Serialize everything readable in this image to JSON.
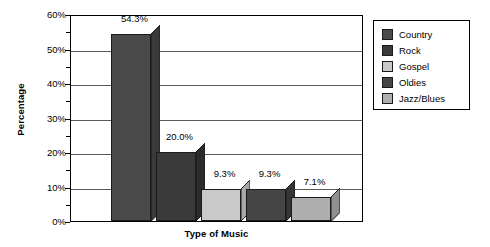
{
  "chart_data": {
    "type": "bar",
    "title": "",
    "xlabel": "Type of Music",
    "ylabel": "Percentage",
    "categories": [
      "Country",
      "Rock",
      "Gospel",
      "Oldies",
      "Jazz/Blues"
    ],
    "values": [
      54.3,
      20.0,
      9.3,
      9.3,
      7.1
    ],
    "data_labels": [
      "54.3%",
      "20.0%",
      "9.3%",
      "9.3%",
      "7.1%"
    ],
    "ylim": [
      0,
      60
    ],
    "y_tick_labels": [
      "0%",
      "10%",
      "20%",
      "30%",
      "40%",
      "50%",
      "60%"
    ],
    "y_tick_values": [
      0,
      10,
      20,
      30,
      40,
      50,
      60
    ],
    "y_minor_tick_values": [
      5,
      15,
      25,
      35,
      45,
      55
    ],
    "grid": "horizontal",
    "legend_position": "right",
    "series_colors": [
      "#4a4a4a",
      "#3a3a3a",
      "#c9c9c9",
      "#454545",
      "#aeaeae"
    ],
    "series_side_colors": [
      "#3a3a3a",
      "#2b2b2b",
      "#a8a8a8",
      "#353535",
      "#8f8f8f"
    ],
    "style": "3d-bars"
  },
  "legend": {
    "items": [
      {
        "label": "Country",
        "color": "#4a4a4a"
      },
      {
        "label": "Rock",
        "color": "#3a3a3a"
      },
      {
        "label": "Gospel",
        "color": "#c9c9c9"
      },
      {
        "label": "Oldies",
        "color": "#454545"
      },
      {
        "label": "Jazz/Blues",
        "color": "#aeaeae"
      }
    ]
  }
}
